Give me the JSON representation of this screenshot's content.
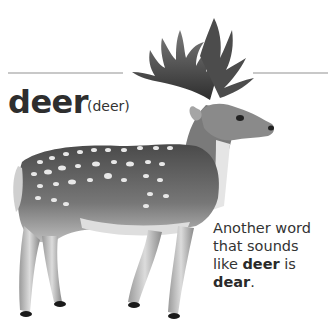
{
  "entry": {
    "headword": "deer",
    "pronunciation": "(deer)",
    "note": {
      "line1": "Another word",
      "line2": "that sounds",
      "line3_pre": "like ",
      "line3_bold": "deer",
      "line3_post": " is",
      "line4_bold": "dear",
      "line4_post": "."
    }
  },
  "illustration": {
    "subject": "fallow-deer-illustration",
    "palette": {
      "body": "#6e6e6e",
      "dark": "#3a3a3a",
      "light": "#d6d6d6",
      "spot": "#e8e8e8"
    }
  }
}
